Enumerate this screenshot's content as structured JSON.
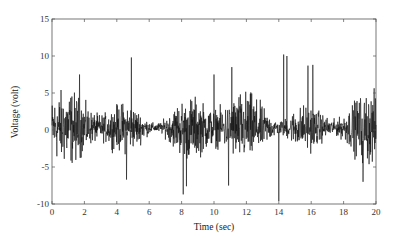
{
  "chart_data": {
    "type": "line",
    "title": "",
    "xlabel": "Time (sec)",
    "ylabel": "Voltage (volt)",
    "xlim": [
      0,
      20
    ],
    "ylim": [
      -10,
      15
    ],
    "xticks": [
      0,
      2,
      4,
      6,
      8,
      10,
      12,
      14,
      16,
      18,
      20
    ],
    "yticks": [
      -10,
      -5,
      0,
      5,
      10,
      15
    ],
    "grid": false,
    "legend": null,
    "series": [
      {
        "name": "voltage",
        "color": "#111111",
        "description": "Dense noisy signal centered near 0 V, mostly within about -5 to +6 V",
        "notable_peaks": [
          {
            "t": 1.7,
            "v": 7.5
          },
          {
            "t": 4.9,
            "v": 9.8
          },
          {
            "t": 4.6,
            "v": 7.8
          },
          {
            "t": 10.0,
            "v": 7.5
          },
          {
            "t": 11.1,
            "v": 8.5
          },
          {
            "t": 14.0,
            "v": 10.4
          },
          {
            "t": 14.3,
            "v": 10.2
          },
          {
            "t": 14.5,
            "v": 10.0
          },
          {
            "t": 15.8,
            "v": 8.7
          },
          {
            "t": 16.1,
            "v": 8.8
          }
        ],
        "notable_troughs": [
          {
            "t": 4.6,
            "v": -6.7
          },
          {
            "t": 8.1,
            "v": -8.7
          },
          {
            "t": 8.3,
            "v": -7.6
          },
          {
            "t": 14.0,
            "v": -9.6
          },
          {
            "t": 10.9,
            "v": -7.5
          },
          {
            "t": 19.2,
            "v": -7.0
          }
        ]
      }
    ]
  },
  "axes": {
    "x_title": "Time (sec)",
    "y_title": "Voltage (volt)",
    "x_tick_labels": [
      "0",
      "2",
      "4",
      "6",
      "8",
      "10",
      "12",
      "14",
      "16",
      "18",
      "20"
    ],
    "y_tick_labels": [
      "-10",
      "-5",
      "0",
      "5",
      "10",
      "15"
    ]
  }
}
